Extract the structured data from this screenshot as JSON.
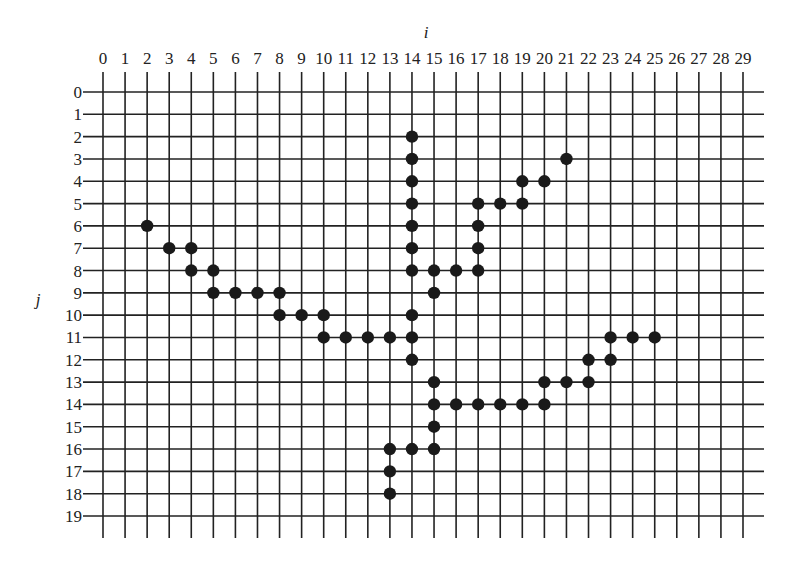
{
  "figure": {
    "axis_i_label": "i",
    "axis_j_label": "j",
    "columns": [
      "0",
      "1",
      "2",
      "3",
      "4",
      "5",
      "6",
      "7",
      "8",
      "9",
      "10",
      "11",
      "12",
      "13",
      "14",
      "15",
      "16",
      "17",
      "18",
      "19",
      "20",
      "21",
      "22",
      "23",
      "24",
      "25",
      "26",
      "27",
      "28",
      "29"
    ],
    "rows": [
      "0",
      "1",
      "2",
      "3",
      "4",
      "5",
      "6",
      "7",
      "8",
      "9",
      "10",
      "11",
      "12",
      "13",
      "14",
      "15",
      "16",
      "17",
      "18",
      "19"
    ],
    "grid_color": "#222222",
    "dot_color": "#1a1a1a",
    "points": [
      [
        2,
        6
      ],
      [
        3,
        7
      ],
      [
        4,
        7
      ],
      [
        4,
        8
      ],
      [
        5,
        8
      ],
      [
        5,
        9
      ],
      [
        6,
        9
      ],
      [
        7,
        9
      ],
      [
        8,
        9
      ],
      [
        8,
        10
      ],
      [
        9,
        10
      ],
      [
        10,
        10
      ],
      [
        10,
        11
      ],
      [
        11,
        11
      ],
      [
        12,
        11
      ],
      [
        13,
        11
      ],
      [
        14,
        2
      ],
      [
        14,
        3
      ],
      [
        14,
        4
      ],
      [
        14,
        5
      ],
      [
        14,
        6
      ],
      [
        14,
        7
      ],
      [
        14,
        8
      ],
      [
        14,
        10
      ],
      [
        14,
        11
      ],
      [
        14,
        12
      ],
      [
        15,
        8
      ],
      [
        15,
        9
      ],
      [
        16,
        8
      ],
      [
        17,
        8
      ],
      [
        17,
        7
      ],
      [
        17,
        6
      ],
      [
        17,
        5
      ],
      [
        18,
        5
      ],
      [
        19,
        5
      ],
      [
        19,
        4
      ],
      [
        20,
        4
      ],
      [
        21,
        3
      ],
      [
        15,
        13
      ],
      [
        15,
        14
      ],
      [
        15,
        15
      ],
      [
        15,
        16
      ],
      [
        14,
        16
      ],
      [
        13,
        16
      ],
      [
        13,
        17
      ],
      [
        13,
        18
      ],
      [
        16,
        14
      ],
      [
        17,
        14
      ],
      [
        18,
        14
      ],
      [
        19,
        14
      ],
      [
        20,
        14
      ],
      [
        20,
        13
      ],
      [
        21,
        13
      ],
      [
        22,
        13
      ],
      [
        22,
        12
      ],
      [
        23,
        12
      ],
      [
        23,
        11
      ],
      [
        24,
        11
      ],
      [
        25,
        11
      ]
    ]
  }
}
